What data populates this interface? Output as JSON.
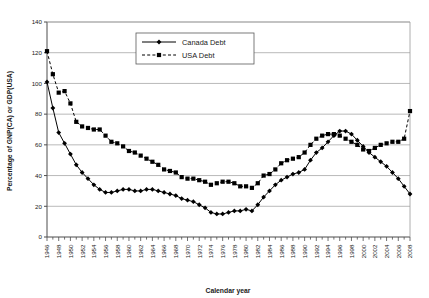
{
  "chart_data": {
    "type": "line",
    "title": "",
    "xlabel": "Calendar year",
    "ylabel": "Percentage of GNP(CA) or GDP(USA)",
    "xlim": [
      1946,
      2008
    ],
    "ylim": [
      0,
      140
    ],
    "ytick_step": 20,
    "yticks": [
      0,
      20,
      40,
      60,
      80,
      100,
      120,
      140
    ],
    "xtick_step": 1,
    "xlabel_step": 2,
    "grid": "horizontal",
    "legend_position": "top-center",
    "x": [
      1946,
      1947,
      1948,
      1949,
      1950,
      1951,
      1952,
      1953,
      1954,
      1955,
      1956,
      1957,
      1958,
      1959,
      1960,
      1961,
      1962,
      1963,
      1964,
      1965,
      1966,
      1967,
      1968,
      1969,
      1970,
      1971,
      1972,
      1973,
      1974,
      1975,
      1976,
      1977,
      1978,
      1979,
      1980,
      1981,
      1982,
      1983,
      1984,
      1985,
      1986,
      1987,
      1988,
      1989,
      1990,
      1991,
      1992,
      1993,
      1994,
      1995,
      1996,
      1997,
      1998,
      1999,
      2000,
      2001,
      2002,
      2003,
      2004,
      2005,
      2006,
      2007,
      2008
    ],
    "xtick_labels": [
      "1946",
      "1948",
      "1950",
      "1952",
      "1954",
      "1956",
      "1958",
      "1960",
      "1962",
      "1964",
      "1966",
      "1968",
      "1970",
      "1972",
      "1974",
      "1976",
      "1978",
      "1980",
      "1982",
      "1984",
      "1986",
      "1988",
      "1990",
      "1992",
      "1994",
      "1996",
      "1998",
      "2000",
      "2002",
      "2004",
      "2006",
      "2008"
    ],
    "series": [
      {
        "name": "Canada Debt",
        "marker": "diamond",
        "linestyle": "solid",
        "color": "#000000",
        "values": [
          101,
          84,
          68,
          61,
          54,
          47,
          42,
          38,
          34,
          31,
          29,
          29,
          30,
          31,
          31,
          30,
          30,
          31,
          31,
          30,
          29,
          28,
          27,
          25,
          24,
          23,
          21,
          19,
          16,
          15,
          15,
          16,
          17,
          17,
          18,
          17,
          21,
          26,
          30,
          34,
          37,
          39,
          41,
          42,
          44,
          50,
          55,
          58,
          62,
          66,
          69,
          69,
          67,
          63,
          59,
          55,
          52,
          49,
          46,
          42,
          38,
          33,
          28
        ]
      },
      {
        "name": "USA Debt",
        "marker": "square",
        "linestyle": "dashed",
        "color": "#000000",
        "values": [
          121,
          106,
          94,
          95,
          87,
          75,
          72,
          71,
          70,
          70,
          66,
          62,
          61,
          59,
          56,
          55,
          53,
          51,
          49,
          47,
          44,
          43,
          42,
          39,
          38,
          38,
          37,
          36,
          34,
          35,
          36,
          36,
          35,
          33,
          33,
          32,
          35,
          40,
          41,
          44,
          48,
          50,
          51,
          52,
          55,
          60,
          64,
          66,
          67,
          67,
          66,
          64,
          62,
          60,
          57,
          56,
          58,
          60,
          61,
          62,
          62,
          64,
          82
        ]
      }
    ]
  },
  "legend": {
    "items": [
      {
        "label": "Canada Debt"
      },
      {
        "label": "USA Debt"
      }
    ]
  },
  "axes": {
    "x_title": "Calendar year",
    "y_title": "Percentage of GNP(CA) or GDP(USA)"
  },
  "colors": {
    "line": "#000000",
    "grid": "#9a9a9a",
    "axis": "#4d4d4d",
    "background": "#ffffff"
  }
}
